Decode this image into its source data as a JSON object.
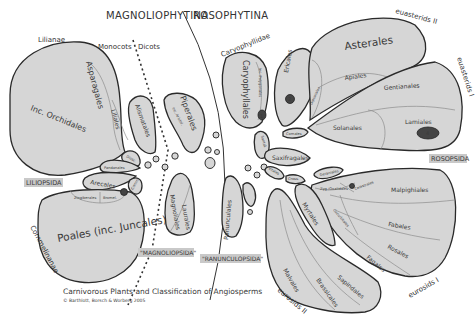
{
  "headers": {
    "left": "MAGNOLIOPHYTINA",
    "right": "ROSOPHYTINA"
  },
  "clades": {
    "lilianae": "Lilianae",
    "monocots": "Monocots",
    "dicots": "Dicots",
    "caryophyllidae": "Caryophyllidae",
    "euasterids_2": "euasterids II",
    "euasterids_1": "euasterids I",
    "eurosids_1": "eurosids I",
    "eurosids_2": "eurosids II",
    "commelinanae": "Commelinanae"
  },
  "class_labels": {
    "liliopsida": "LILIOPSIDA",
    "magnoliopsida": "\"MAGNOLIOPSIDA\"",
    "ranunculopsida": "\"RANUNCULOPSIDA\"",
    "rosopsida": "ROSOPSIDA"
  },
  "orders": {
    "asparagales": "Asparagales",
    "inc_orchidales": "Inc. Orchidales",
    "liliales": "Liliales",
    "alismatales": "Alismatales",
    "dioscoreales": "Diosc.",
    "pandanales": "Pandanales",
    "arecales": "Arecales",
    "commelinales": "Comm.",
    "zingiberales": "Zingiberales",
    "bromeliaceae": "Bromel.",
    "poales": "Poales (inc. Juncales)",
    "piperales": "Piperales",
    "inc_aristolochiales": "inc. Aristol.",
    "magnoliales": "Magnoliales",
    "laurales": "Laurales",
    "ranunculales": "Ranunculales",
    "caryophyllales": "Caryophyllales",
    "inc_polygonales": "Inc. Polygonales",
    "ericales": "Ericales",
    "dipsacales": "Dipsacales",
    "asterales": "Asterales",
    "apiales": "Apiales",
    "gentianales": "Gentianales",
    "solanales": "Solanales",
    "lamiales": "Lamiales",
    "cornales": "Cornales",
    "santalales": "Santal.",
    "saxifragales": "Saxifragales",
    "vitales": "Vitales",
    "geraniales": "Geraniales",
    "crossosomatales": "Cross.",
    "zygophyllales_oxalidales": "Zyg./Oxalidales",
    "celastrales": "Celastrales",
    "malpighiales": "Malpighiales",
    "fabales": "Fabales",
    "rosales": "Rosales",
    "fagales": "Fagales",
    "cucurbitales": "Cucurbitales",
    "myrtales": "Myrtales",
    "malvales": "Malvales",
    "brassicales": "Brassicales",
    "sapindales": "Sapindales",
    "small_circles": [
      "Acorus",
      "Cerat.",
      "Chlor.",
      "Canell.",
      "Amborella",
      "Nymph.",
      "Austrob.",
      "Buxal.",
      "Gunnera",
      "Dillen.",
      "Sabiac.",
      "Proteales",
      "Troch.",
      "Berber.",
      "Santal.",
      "Vit."
    ]
  },
  "markers": [
    {
      "id": "1",
      "order": "Caryophyllales"
    },
    {
      "id": "2",
      "order": "Ericales"
    },
    {
      "id": "4",
      "order": "Lamiales"
    }
  ],
  "caption": {
    "title": "Carnivorous Plants and Classification of Angiosperms",
    "credit": "© Barthlott, Borsch & Worberg 2005"
  }
}
